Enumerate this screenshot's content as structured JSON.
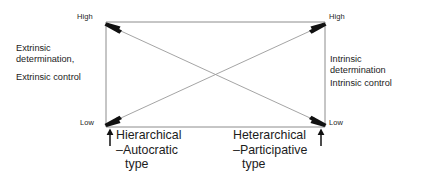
{
  "figure": {
    "name": "leadership-type-determination-diagram",
    "type": "diagram",
    "axes": {
      "left_axis": {
        "name": "extrinsic-axis",
        "top_label": "High",
        "bottom_label": "Low"
      },
      "right_axis": {
        "name": "intrinsic-axis",
        "top_label": "High",
        "bottom_label": "Low"
      }
    },
    "side_labels": {
      "left": {
        "lines": [
          "Extrinsic",
          "determination,"
        ],
        "second": "Extrinsic control"
      },
      "right": {
        "lines": [
          "Intrinsic",
          "determination"
        ],
        "second": "Intrinsic control"
      }
    },
    "bottom_labels": {
      "left": {
        "lines": [
          "Hierarchical",
          "–Autocratic",
          "type"
        ],
        "marker": "up-arrow"
      },
      "right": {
        "lines": [
          "Heterarchical",
          "–Participative",
          "type"
        ],
        "marker": "up-arrow"
      }
    },
    "colors": {
      "line": "#8c8c8c",
      "arrow": "#111111",
      "text": "#1c1c1c",
      "background": "#ffffff"
    }
  }
}
